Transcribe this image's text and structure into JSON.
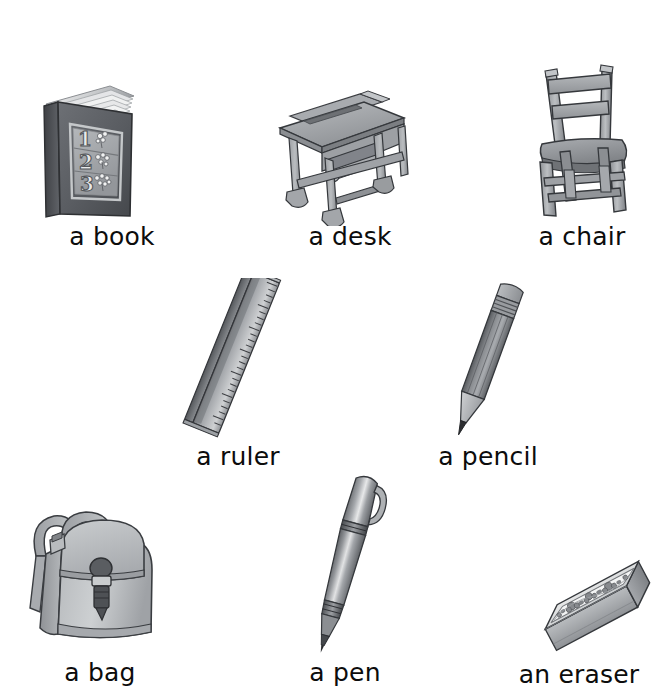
{
  "page": {
    "background_color": "#ffffff",
    "text_color": "#0c0c0c",
    "palette": {
      "ink_dark": "#3f4145",
      "ink_mid": "#6f7276",
      "ink_light": "#a7aaae",
      "paper_light": "#d7d9db",
      "highlight": "#eceded",
      "outline": "#2e3033"
    },
    "layout": "3-2-3 grid of illustrated flash-card items",
    "style": "grayscale watercolor illustrations with handwriting-style sans captions"
  },
  "items": [
    {
      "id": "book",
      "label": "a book",
      "icon": "book-icon",
      "cover_numbers": [
        "1",
        "2",
        "3"
      ],
      "cover_detail": "flower clusters beside each numeral",
      "row": 1,
      "column": 1
    },
    {
      "id": "desk",
      "label": "a desk",
      "icon": "desk-icon",
      "detail": "school desk with sloped lid, pencil groove and under-shelf",
      "row": 1,
      "column": 2
    },
    {
      "id": "chair",
      "label": "a chair",
      "icon": "chair-icon",
      "detail": "wooden ladder-back chair with two slats and stretcher bars",
      "row": 1,
      "column": 3
    },
    {
      "id": "ruler",
      "label": "a ruler",
      "icon": "ruler-icon",
      "detail": "bevelled ruler tilted diagonally with graduation marks",
      "row": 2,
      "column": 1
    },
    {
      "id": "pencil",
      "label": "a pencil",
      "icon": "pencil-icon",
      "detail": "sharpened pencil with ferrule and eraser, tilted diagonally",
      "row": 2,
      "column": 2
    },
    {
      "id": "bag",
      "label": "a bag",
      "icon": "backpack-icon",
      "detail": "backpack with two shoulder straps, flap and buckle",
      "row": 3,
      "column": 1
    },
    {
      "id": "pen",
      "label": "a pen",
      "icon": "pen-icon",
      "detail": "ballpoint pen with clip and banded grip, tilted",
      "row": 3,
      "column": 2
    },
    {
      "id": "eraser",
      "label": "an eraser",
      "icon": "eraser-icon",
      "detail": "rectangular eraser in a printed floral sleeve",
      "row": 3,
      "column": 3
    }
  ]
}
